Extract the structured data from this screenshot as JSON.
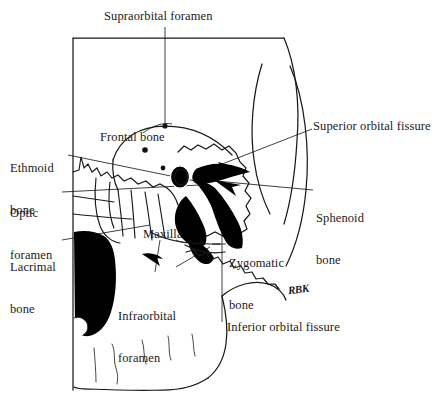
{
  "figure": {
    "type": "anatomical-line-drawing",
    "background_color": "#ffffff",
    "line_color": "#1a1a1a",
    "fill_color": "#000000",
    "width": 448,
    "height": 419
  },
  "labels": {
    "supraorbital_foramen": "Supraorbital foramen",
    "frontal_bone": "Frontal bone",
    "superior_orbital_fissure": "Superior orbital fissure",
    "ethmoid_bone_line1": "Ethmoid",
    "ethmoid_bone_line2": "bone",
    "optic_foramen_line1": "Optic",
    "optic_foramen_line2": "foramen",
    "sphenoid_bone_line1": "Sphenoid",
    "sphenoid_bone_line2": "bone",
    "lacrimal_bone_line1": "Lacrimal",
    "lacrimal_bone_line2": "bone",
    "maxilla": "Maxilla",
    "zygomatic_bone_line1": "Zygomatic",
    "zygomatic_bone_line2": "bone",
    "infraorbital_foramen_line1": "Infraorbital",
    "infraorbital_foramen_line2": "foramen",
    "inferior_orbital_fissure": "Inferior orbital fissure",
    "artist_signature": "RBK"
  }
}
